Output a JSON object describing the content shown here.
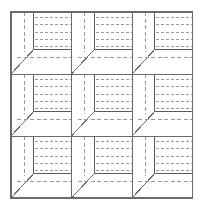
{
  "figure": {
    "type": "line-diagram",
    "canvas": {
      "width": 203,
      "height": 210,
      "background": "#ffffff"
    },
    "grid": {
      "rows": 3,
      "cols": 3,
      "origin_x": 11,
      "origin_y": 12,
      "cell_width": 60.5,
      "cell_height": 62.0,
      "total_width": 181.5,
      "total_height": 186.0
    },
    "style": {
      "outer_border_color": "#6b6b6b",
      "outer_border_width": 1.1,
      "divider_color": "#6b6b6b",
      "divider_width": 1.0,
      "solid_edge_color": "#5a5a5a",
      "solid_edge_width": 1.0,
      "diagonal_color": "#6e6e6e",
      "diagonal_width": 1.0,
      "dashed_color": "#9a9a9a",
      "dashed_width": 1.0,
      "dash_pattern": "3,2",
      "dash_pattern_long": "4,2.5"
    },
    "cell_geometry": {
      "note": "All coordinates are fractions of one cell's width/height",
      "vertical_dashed_x": 0.215,
      "vertical_dashed_y_top": 0.0,
      "vertical_dashed_y_bottom": 0.645,
      "inner_corner_x": 0.215,
      "inner_corner_y": 0.645,
      "inner_vertical_x": 0.38,
      "inner_vertical_y_top": 0.0,
      "inner_vertical_y_bottom": 0.6,
      "inner_horizontal_y": 0.6,
      "inner_horizontal_x_left": 0.38,
      "inner_horizontal_x_right": 1.0,
      "diagonal_x1": 0.0,
      "diagonal_y1": 1.0,
      "diagonal_x2": 0.38,
      "diagonal_y2": 0.6,
      "lower_dashed_y": 0.74,
      "lower_dashed_x_left": 0.105,
      "lower_dashed_x_right": 1.0,
      "face_dashed_x_left": 0.4,
      "face_dashed_x_right": 1.0,
      "face_dashed_rows": [
        0.085,
        0.205,
        0.325,
        0.445,
        0.555
      ]
    },
    "labels": {
      "figure_caption": "",
      "axis_x": "",
      "axis_y": ""
    }
  }
}
